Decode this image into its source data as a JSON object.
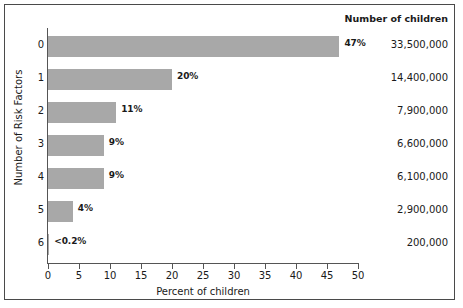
{
  "chart_data": {
    "type": "bar",
    "orientation": "horizontal",
    "title": "",
    "xlabel": "Percent of children",
    "ylabel": "Number of Risk Factors",
    "categories": [
      "0",
      "1",
      "2",
      "3",
      "4",
      "5",
      "6"
    ],
    "values": [
      47,
      20,
      11,
      9,
      9,
      4,
      0.2
    ],
    "value_labels": [
      "47%",
      "20%",
      "11%",
      "9%",
      "9%",
      "4%",
      "<0.2%"
    ],
    "xlim": [
      0,
      50
    ],
    "xticks": [
      0,
      5,
      10,
      15,
      20,
      25,
      30,
      35,
      40,
      45,
      50
    ],
    "xticklabels": [
      "0",
      "5",
      "10",
      "15",
      "20",
      "25",
      "30",
      "35",
      "40",
      "45",
      "50"
    ],
    "grid": false,
    "legend": "none",
    "bar_color": "#a8a8a8",
    "axis_color": "#555555",
    "text_color": "#1a1a1a",
    "annotation_column": {
      "header": "Number of children",
      "values": [
        "33,500,000",
        "14,400,000",
        "7,900,000",
        "6,600,000",
        "6,100,000",
        "2,900,000",
        "200,000"
      ]
    }
  }
}
